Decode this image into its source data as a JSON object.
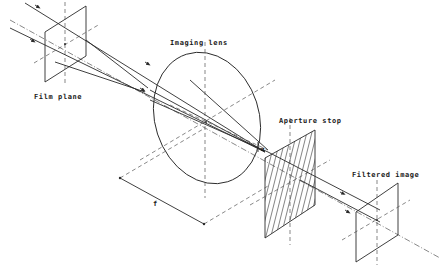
{
  "diagram": {
    "type": "optical-system-isometric",
    "labels": {
      "film_plane": "Film plane",
      "imaging_lens": "Imaging lens",
      "aperture_stop": "Aperture stop",
      "filtered_image": "Filtered image",
      "focal_length": "f",
      "angle": "α"
    },
    "components": [
      {
        "id": "film-plane",
        "label": "Film plane"
      },
      {
        "id": "imaging-lens",
        "label": "Imaging lens"
      },
      {
        "id": "aperture-stop",
        "label": "Aperture stop"
      },
      {
        "id": "filtered-image",
        "label": "Filtered image"
      }
    ],
    "dimension": {
      "symbol": "f",
      "meaning": "distance between lens and aperture stop"
    },
    "colors": {
      "line": "#2a2a2a",
      "background": "#ffffff"
    }
  }
}
